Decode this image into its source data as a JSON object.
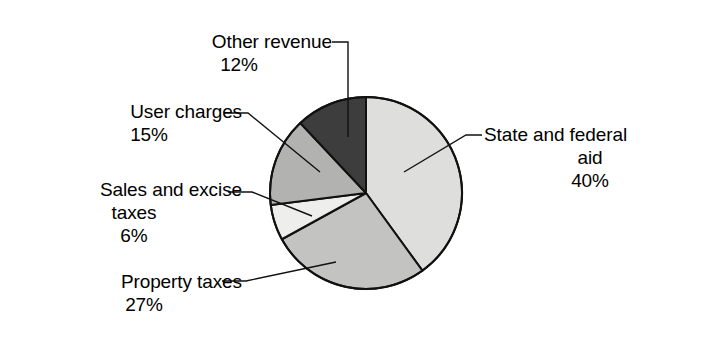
{
  "chart_data": {
    "type": "pie",
    "title": "",
    "subtitle": "",
    "xlabel": "",
    "ylabel": "",
    "legend_position": "callout-labels",
    "grid": false,
    "units": "percent",
    "total": 100,
    "categories": [
      "State and federal aid",
      "Property taxes",
      "Sales and excise taxes",
      "User charges",
      "Other revenue"
    ],
    "values": [
      40,
      27,
      6,
      15,
      12
    ],
    "slices": [
      {
        "label": "State and federal aid",
        "label_line1": "State and federal",
        "label_line2": "aid",
        "value": 40,
        "percent_text": "40%",
        "color": "#dededd",
        "start_angle": 0,
        "end_angle": 144,
        "leader_anchor": "left"
      },
      {
        "label": "Property taxes",
        "label_line1": "Property taxes",
        "label_line2": "",
        "value": 27,
        "percent_text": "27%",
        "color": "#c3c3c2",
        "start_angle": 144,
        "end_angle": 241.2,
        "leader_anchor": "right"
      },
      {
        "label": "Sales and excise taxes",
        "label_line1": "Sales and excise",
        "label_line2": "taxes",
        "value": 6,
        "percent_text": "6%",
        "color": "#eeeeed",
        "start_angle": 241.2,
        "end_angle": 262.8,
        "leader_anchor": "right"
      },
      {
        "label": "User charges",
        "label_line1": "User charges",
        "label_line2": "",
        "value": 15,
        "percent_text": "15%",
        "color": "#b2b2b1",
        "start_angle": 262.8,
        "end_angle": 316.8,
        "leader_anchor": "right"
      },
      {
        "label": "Other revenue",
        "label_line1": "Other revenue",
        "label_line2": "",
        "value": 12,
        "percent_text": "12%",
        "color": "#3d3d3d",
        "start_angle": 316.8,
        "end_angle": 360,
        "leader_anchor": "right"
      }
    ],
    "geometry": {
      "center_x": 366,
      "center_y": 193,
      "radius": 96,
      "outline_color": "#111111",
      "outline_width": 2,
      "background": "#ffffff"
    }
  }
}
